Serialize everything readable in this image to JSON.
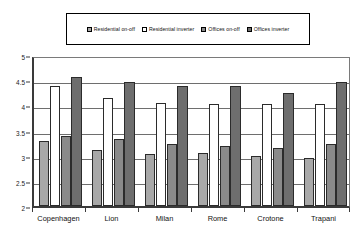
{
  "chart_data": {
    "type": "bar",
    "title": "",
    "xlabel": "",
    "ylabel": "",
    "ylim": [
      2,
      5
    ],
    "yticks": [
      2,
      2.5,
      3,
      3.5,
      4,
      4.5,
      5
    ],
    "ytick_labels": [
      "2",
      "2.5",
      "3",
      "3.5",
      "4",
      "4.5",
      "5"
    ],
    "grid": true,
    "legend_position": "top",
    "categories": [
      "Copenhagen",
      "Lion",
      "Milan",
      "Rome",
      "Crotone",
      "Trapani"
    ],
    "series": [
      {
        "name": "Residential on-off",
        "color": "#a8a8a8",
        "values": [
          3.3,
          3.12,
          3.03,
          3.05,
          2.99,
          2.96
        ]
      },
      {
        "name": "Residential inverter",
        "color": "#ffffff",
        "values": [
          4.38,
          4.14,
          4.05,
          4.02,
          4.02,
          4.02
        ]
      },
      {
        "name": "Offices on-off",
        "color": "#8a8a8a",
        "values": [
          3.4,
          3.33,
          3.23,
          3.2,
          3.15,
          3.23
        ]
      },
      {
        "name": "Offices inverter",
        "color": "#6e6e6e",
        "values": [
          4.57,
          4.47,
          4.38,
          4.38,
          4.25,
          4.47
        ]
      }
    ]
  },
  "legend": {
    "items": [
      {
        "label": "Residential on-off",
        "swatch": "#a8a8a8"
      },
      {
        "label": "Residential inverter",
        "swatch": "#ffffff"
      },
      {
        "label": "Offices on-off",
        "swatch": "#8a8a8a"
      },
      {
        "label": "Offices inverter",
        "swatch": "#6e6e6e"
      }
    ]
  }
}
